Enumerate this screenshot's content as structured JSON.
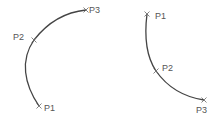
{
  "diagrams": [
    {
      "name": "arc-left",
      "points": [
        {
          "label": "P1",
          "x": 39,
          "y": 106
        },
        {
          "label": "P2",
          "x": 34,
          "y": 40
        },
        {
          "label": "P3",
          "x": 86,
          "y": 10
        }
      ]
    },
    {
      "name": "arc-right",
      "points": [
        {
          "label": "P1",
          "x": 147,
          "y": 14
        },
        {
          "label": "P2",
          "x": 156,
          "y": 71
        },
        {
          "label": "P3",
          "x": 204,
          "y": 100
        }
      ]
    }
  ],
  "colors": {
    "arc": "#444444",
    "label": "#555555"
  }
}
